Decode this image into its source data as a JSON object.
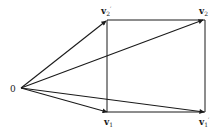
{
  "diagram": {
    "type": "vector-diagram",
    "origin": {
      "label": "0",
      "x": 21,
      "y": 88
    },
    "vectors": [
      {
        "id": "v2_prime",
        "name": "v",
        "sub": "2",
        "prime": "′",
        "tip": [
          107,
          21
        ]
      },
      {
        "id": "v2",
        "name": "v",
        "sub": "2",
        "prime": "",
        "tip": [
          204,
          20
        ]
      },
      {
        "id": "v1",
        "name": "v",
        "sub": "1",
        "prime": "",
        "tip": [
          108,
          112
        ]
      },
      {
        "id": "v1_prime",
        "name": "v",
        "sub": "1",
        "prime": "′",
        "tip": [
          205,
          112
        ]
      }
    ],
    "rectangle": {
      "x1": 107,
      "y1": 20,
      "x2": 205,
      "y2": 112
    },
    "colors": {
      "stroke": "#1a1a1a",
      "background": "#ffffff"
    }
  }
}
